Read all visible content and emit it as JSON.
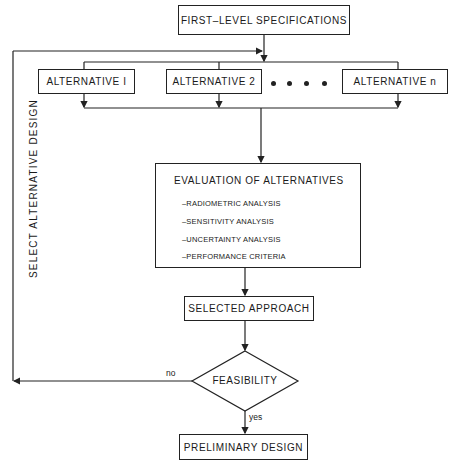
{
  "diagram": {
    "type": "flowchart",
    "nodes": {
      "first_level": "FIRST–LEVEL SPECIFICATIONS",
      "alternatives": [
        {
          "label": "ALTERNATIVE I"
        },
        {
          "label": "ALTERNATIVE 2"
        },
        {
          "label": "ALTERNATIVE  n"
        }
      ],
      "ellipsis": "• • • •",
      "evaluation": {
        "title": "EVALUATION OF ALTERNATIVES",
        "items": [
          "–RADIOMETRIC ANALYSIS",
          "–SENSITIVITY ANALYSIS",
          "–UNCERTAINTY ANALYSIS",
          "–PERFORMANCE CRITERIA"
        ]
      },
      "selected": "SELECTED APPROACH",
      "decision": "FEASIBILITY",
      "final": "PRELIMINARY DESIGN"
    },
    "edge_labels": {
      "no": "no",
      "yes": "yes",
      "feedback": "SELECT ALTERNATIVE DESIGN"
    },
    "colors": {
      "line": "#222222",
      "background": "#ffffff"
    }
  }
}
